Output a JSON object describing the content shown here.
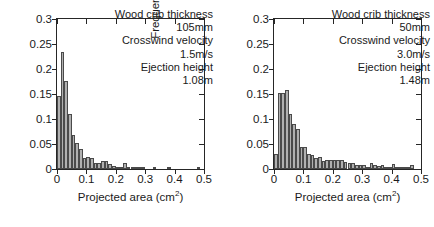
{
  "figure": {
    "panel_count": 2,
    "background_color": "#ffffff",
    "bar_fill_color": "#b0b0b0",
    "bar_edge_color": "#4a4a4a",
    "axis_color": "#262626"
  },
  "panels": [
    {
      "id": "left",
      "ylabel": "Frequency",
      "xlabel_text": "Projected area (cm",
      "xlabel_sup": "2",
      "xlabel_tail": ")",
      "annotation": {
        "line1": "Wood crib thickness",
        "line2": "105mm",
        "line3": "Crosswind velocity",
        "line4": "1.5m/s",
        "line5": "Ejection height",
        "line6": "1.08m"
      },
      "ytick_labels": [
        "0",
        "0.05",
        "0.1",
        "0.15",
        "0.2",
        "0.25",
        "0.3"
      ],
      "xtick_labels": [
        "0",
        "0.1",
        "0.2",
        "0.3",
        "0.4",
        "0.5"
      ]
    },
    {
      "id": "right",
      "ylabel": "Frequency",
      "xlabel_text": "Projected area (cm",
      "xlabel_sup": "2",
      "xlabel_tail": ")",
      "annotation": {
        "line1": "Wood crib thickness",
        "line2": "50mm",
        "line3": "Crosswind velocity",
        "line4": "3.0m/s",
        "line5": "Ejection height",
        "line6": "1.48m"
      },
      "ytick_labels": [
        "0",
        "0.05",
        "0.1",
        "0.15",
        "0.2",
        "0.25",
        "0.3"
      ],
      "xtick_labels": [
        "0",
        "0.1",
        "0.2",
        "0.3",
        "0.4",
        "0.5"
      ]
    }
  ],
  "chart_data": [
    {
      "type": "bar",
      "title": "",
      "subtitle": "Wood crib thickness 105mm, Crosswind velocity 1.5m/s, Ejection height 1.08m",
      "xlabel": "Projected area (cm^2)",
      "ylabel": "Frequency",
      "xlim": [
        0,
        0.5
      ],
      "ylim": [
        0,
        0.3
      ],
      "xticks": [
        0,
        0.1,
        0.2,
        0.3,
        0.4,
        0.5
      ],
      "yticks": [
        0,
        0.05,
        0.1,
        0.15,
        0.2,
        0.25,
        0.3
      ],
      "grid": false,
      "legend": false,
      "bin_width": 0.0125,
      "bin_left_edges": [
        0.0,
        0.0125,
        0.025,
        0.0375,
        0.05,
        0.0625,
        0.075,
        0.0875,
        0.1,
        0.1125,
        0.125,
        0.1375,
        0.15,
        0.1625,
        0.175,
        0.1875,
        0.2,
        0.2125,
        0.225,
        0.2375,
        0.25,
        0.2625,
        0.275,
        0.2875,
        0.3,
        0.3125,
        0.325,
        0.3375,
        0.35,
        0.3625,
        0.375,
        0.3875,
        0.4,
        0.4125,
        0.425,
        0.4375,
        0.45,
        0.4625,
        0.475,
        0.4875
      ],
      "values": [
        0.146,
        0.235,
        0.177,
        0.111,
        0.068,
        0.052,
        0.04,
        0.023,
        0.024,
        0.023,
        0.013,
        0.012,
        0.017,
        0.017,
        0.011,
        0.006,
        0.004,
        0.004,
        0.013,
        0.003,
        0.002,
        0.001,
        0.001,
        0.001,
        0.0,
        0.0,
        0.002,
        0.0,
        0.0,
        0.0,
        0.001,
        0.0,
        0.0,
        0.0,
        0.0,
        0.0,
        0.0,
        0.0,
        0.001,
        0.0
      ],
      "peak_value": 0.235,
      "peak_bin_center": 0.019
    },
    {
      "type": "bar",
      "title": "",
      "subtitle": "Wood crib thickness 50mm, Crosswind velocity 3.0m/s, Ejection height 1.48m",
      "xlabel": "Projected area (cm^2)",
      "ylabel": "Frequency",
      "xlim": [
        0,
        0.5
      ],
      "ylim": [
        0,
        0.3
      ],
      "xticks": [
        0,
        0.1,
        0.2,
        0.3,
        0.4,
        0.5
      ],
      "yticks": [
        0,
        0.05,
        0.1,
        0.15,
        0.2,
        0.25,
        0.3
      ],
      "grid": false,
      "legend": false,
      "bin_width": 0.0125,
      "bin_left_edges": [
        0.0,
        0.0125,
        0.025,
        0.0375,
        0.05,
        0.0625,
        0.075,
        0.0875,
        0.1,
        0.1125,
        0.125,
        0.1375,
        0.15,
        0.1625,
        0.175,
        0.1875,
        0.2,
        0.2125,
        0.225,
        0.2375,
        0.25,
        0.2625,
        0.275,
        0.2875,
        0.3,
        0.3125,
        0.325,
        0.3375,
        0.35,
        0.3625,
        0.375,
        0.3875,
        0.4,
        0.4125,
        0.425,
        0.4375,
        0.45,
        0.4625,
        0.475,
        0.4875
      ],
      "values": [
        0.031,
        0.152,
        0.153,
        0.159,
        0.11,
        0.09,
        0.08,
        0.045,
        0.044,
        0.03,
        0.029,
        0.023,
        0.024,
        0.016,
        0.018,
        0.018,
        0.019,
        0.019,
        0.019,
        0.014,
        0.013,
        0.012,
        0.009,
        0.008,
        0.008,
        0.004,
        0.012,
        0.009,
        0.006,
        0.008,
        0.004,
        0.002,
        0.01,
        0.002,
        0.002,
        0.002,
        0.001,
        0.009,
        0.0,
        0.0
      ],
      "peak_value": 0.159,
      "peak_bin_center": 0.044
    }
  ]
}
